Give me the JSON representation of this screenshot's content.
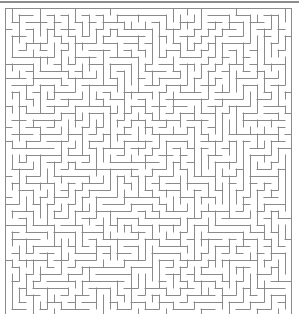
{
  "page": {
    "width": 299,
    "height": 317,
    "background": "#ffffff"
  },
  "top_rule": {
    "name": "horizontal-rule",
    "x": 0,
    "y": 1,
    "width": 299,
    "height": 2,
    "color": "#8d8d8d"
  },
  "maze": {
    "name": "maze-grid",
    "type": "perfect-maze",
    "origin_x": 5,
    "origin_y": 8,
    "pixel_width": 287,
    "pixel_height": 306,
    "columns": 41,
    "rows": 44,
    "cell_size": 7,
    "wall_color": "#8a8a8a",
    "wall_thickness": 1,
    "background": "#ffffff",
    "border": "closed",
    "seed": 20240517,
    "solution_shown": false,
    "entrance": null,
    "exit": null
  }
}
